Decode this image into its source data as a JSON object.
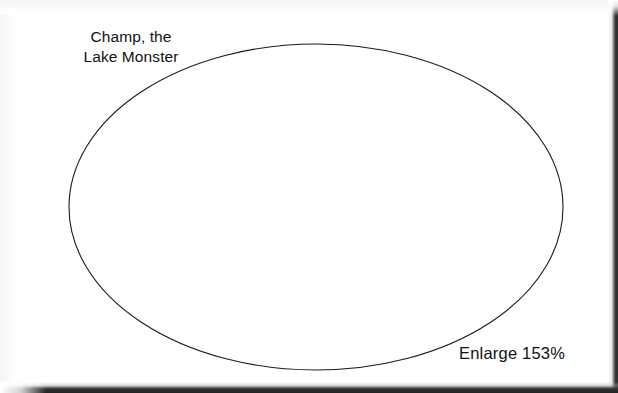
{
  "document": {
    "kind": "scanned-worksheet-page",
    "background_color": "#ffffff",
    "ink_color": "#1a1a1c",
    "scan_edge_color": "#2b2b2d"
  },
  "annotations": {
    "title_label": "Champ, the\nLake Monster",
    "title_line_1": "Champ, the",
    "title_line_2": "Lake Monster",
    "enlarge_label": "Enlarge 153%",
    "enlarge_percent": "153%"
  },
  "shape": {
    "name": "ellipse-outline",
    "stroke_color": "#1a1a1c",
    "stroke_width": "1.1",
    "fill": "none",
    "center_x": 316,
    "center_y": 207,
    "radius_x": 247,
    "radius_y": 163
  }
}
